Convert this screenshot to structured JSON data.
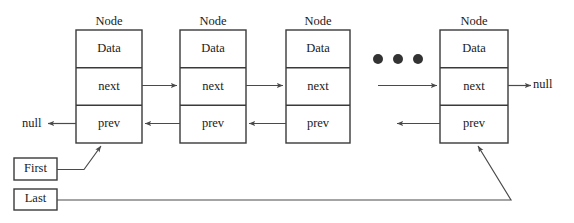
{
  "diagram": {
    "type": "doubly-linked-list",
    "colors": {
      "background": "#ffffff",
      "stroke": "#3a3a3a",
      "connector": "#4a4a4a",
      "text": "#1a1a1a",
      "dot": "#333333"
    },
    "node_label": "Node",
    "cell_labels": {
      "data": "Data",
      "next": "next",
      "prev": "prev"
    },
    "nodes": [
      {
        "id": "node-1",
        "label": "Node",
        "cells": [
          "Data",
          "next",
          "prev"
        ],
        "x": 76,
        "y": 30,
        "width": 66,
        "height": 113
      },
      {
        "id": "node-2",
        "label": "Node",
        "cells": [
          "Data",
          "next",
          "prev"
        ],
        "x": 180,
        "y": 30,
        "width": 66,
        "height": 113
      },
      {
        "id": "node-3",
        "label": "Node",
        "cells": [
          "Data",
          "next",
          "prev"
        ],
        "x": 286,
        "y": 30,
        "width": 64,
        "height": 113
      },
      {
        "id": "node-4",
        "label": "Node",
        "cells": [
          "Data",
          "next",
          "prev"
        ],
        "x": 440,
        "y": 30,
        "width": 68,
        "height": 113
      }
    ],
    "pointers": [
      {
        "id": "first-pointer",
        "label": "First",
        "x": 14,
        "y": 158,
        "width": 43,
        "height": 22
      },
      {
        "id": "last-pointer",
        "label": "Last",
        "x": 14,
        "y": 189,
        "width": 43,
        "height": 21
      }
    ],
    "null_terminators": [
      {
        "id": "null-left",
        "label": "null",
        "x": 22,
        "y": 124,
        "side": "left"
      },
      {
        "id": "null-right",
        "label": "null",
        "x": 533,
        "y": 84,
        "side": "right"
      }
    ],
    "ellipsis": {
      "id": "ellipsis",
      "label": "...",
      "dot_count": 3,
      "dots_x": [
        378,
        398,
        418
      ],
      "dots_y": 59,
      "radius": 5
    },
    "edges": [
      {
        "id": "next-1-to-2",
        "from": "node-1.next",
        "to": "node-2",
        "direction": "right"
      },
      {
        "id": "next-2-to-3",
        "from": "node-2.next",
        "to": "node-3",
        "direction": "right"
      },
      {
        "id": "next-gap-to-4",
        "from": "ellipsis",
        "to": "node-4.next",
        "direction": "right"
      },
      {
        "id": "next-4-to-null",
        "from": "node-4.next",
        "to": "null-right",
        "direction": "right"
      },
      {
        "id": "prev-1-to-null",
        "from": "node-1.prev",
        "to": "null-left",
        "direction": "left"
      },
      {
        "id": "prev-2-to-1",
        "from": "node-2.prev",
        "to": "node-1",
        "direction": "left"
      },
      {
        "id": "prev-3-to-2",
        "from": "node-3.prev",
        "to": "node-2",
        "direction": "left"
      },
      {
        "id": "prev-4-to-gap",
        "from": "node-4.prev",
        "to": "ellipsis",
        "direction": "left"
      },
      {
        "id": "first-to-node-1",
        "from": "first-pointer",
        "to": "node-1.prev",
        "direction": "up-right"
      },
      {
        "id": "last-to-node-4",
        "from": "last-pointer",
        "to": "node-4.prev",
        "direction": "up-right"
      }
    ]
  }
}
